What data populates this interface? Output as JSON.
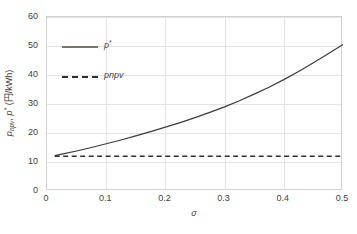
{
  "chart_data": {
    "type": "line",
    "title": "",
    "xlabel": "σ",
    "ylabel": "p_npv, p* (円/kWh)",
    "ylabel_parts": {
      "var1": "p",
      "var1_sub": "npv",
      "sep": ", ",
      "var2": "p",
      "var2_sup": "*",
      "unit": " (円/kWh)"
    },
    "xlim": [
      0,
      0.5
    ],
    "ylim": [
      0,
      60
    ],
    "xticks": [
      0,
      0.1,
      0.2,
      0.3,
      0.4,
      0.5
    ],
    "xtick_labels": [
      "0",
      "0.1",
      "0.2",
      "0.3",
      "0.4",
      "0.5"
    ],
    "yticks": [
      0,
      10,
      20,
      30,
      40,
      50,
      60
    ],
    "ytick_labels": [
      "0",
      "10",
      "20",
      "30",
      "40",
      "50",
      "60"
    ],
    "grid": true,
    "legend_position": "upper-left-inside",
    "series": [
      {
        "name": "p*",
        "legend_label": "p",
        "legend_sup": "*",
        "style": "solid",
        "color": "#3a3a3a",
        "legend_swatch_color": "#7d7363",
        "x": [
          0.013,
          0.025,
          0.05,
          0.075,
          0.1,
          0.125,
          0.15,
          0.175,
          0.2,
          0.225,
          0.25,
          0.275,
          0.3,
          0.325,
          0.35,
          0.375,
          0.4,
          0.425,
          0.45,
          0.475,
          0.5
        ],
        "values": [
          12.2,
          12.7,
          13.8,
          15.0,
          16.3,
          17.6,
          19.0,
          20.5,
          22.0,
          23.6,
          25.3,
          27.1,
          29.0,
          31.1,
          33.4,
          35.8,
          38.4,
          41.2,
          44.2,
          47.3,
          50.5
        ]
      },
      {
        "name": "pnpv",
        "legend_label": "pnpv",
        "style": "dashed",
        "color": "#2e2e2e",
        "legend_swatch_color": "#2e2e2e",
        "x": [
          0.013,
          0.5
        ],
        "values": [
          12.0,
          12.0
        ],
        "constant_value": 12.0
      }
    ]
  },
  "caption": {
    "text": ""
  }
}
